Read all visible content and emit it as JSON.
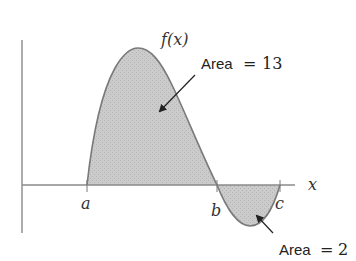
{
  "diagram": {
    "function_label": "f(x)",
    "x_axis_label": "x",
    "points": [
      {
        "id": "a",
        "label": "a"
      },
      {
        "id": "b",
        "label": "b"
      },
      {
        "id": "c",
        "label": "c"
      }
    ],
    "annotations": [
      {
        "id": "area_positive",
        "prefix": "Area",
        "eq": "=",
        "value": "13"
      },
      {
        "id": "area_negative",
        "prefix": "Area",
        "eq": "=",
        "value": "2"
      }
    ],
    "colors": {
      "fill": "#c9c9c9",
      "curve": "#7a7a7a",
      "axis": "#8a8a8a",
      "arrow": "#222222"
    }
  }
}
